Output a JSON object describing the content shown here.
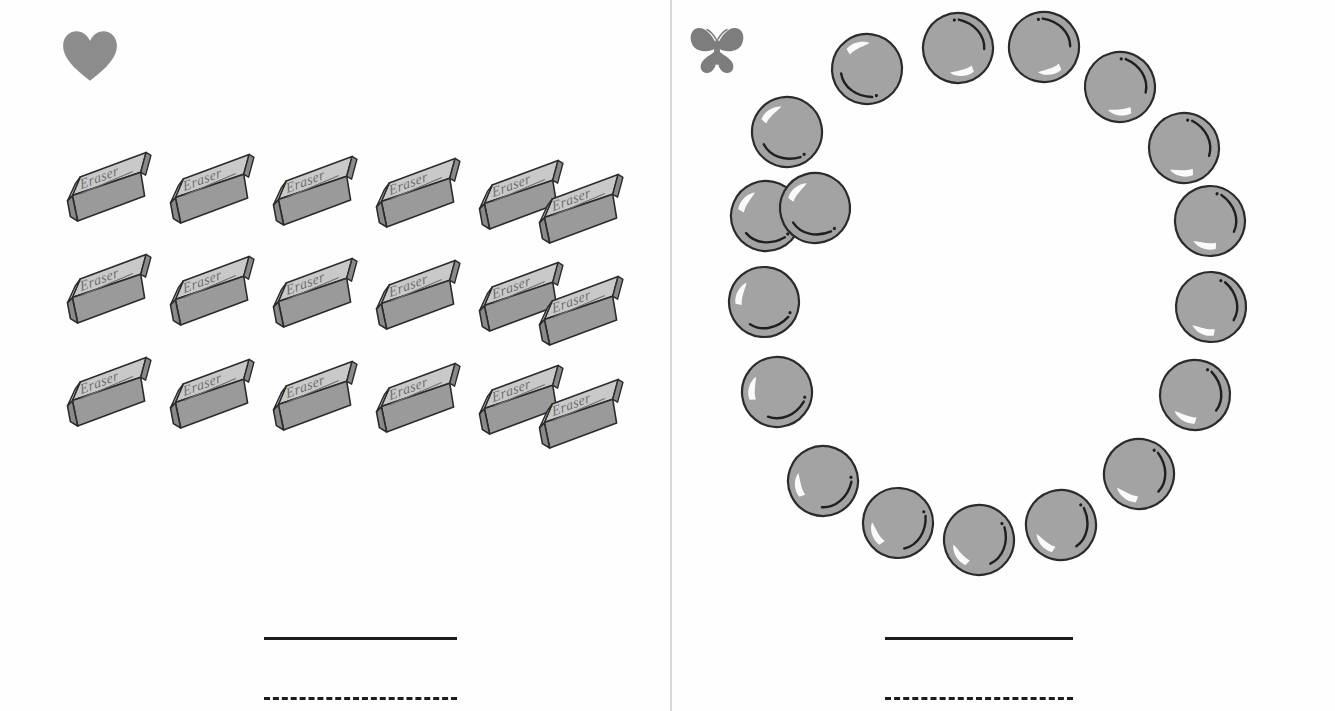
{
  "worksheet": {
    "title": "Counting Worksheet",
    "background_color": "#fefefe",
    "divider_color": "#d8d8d8"
  },
  "panels": [
    {
      "id": "left",
      "marker_icon": "heart-icon",
      "marker_color": "#8c8c8c",
      "object_name": "Eraser",
      "object_label": "Eraser",
      "arrangement": "grid",
      "rows": 3,
      "columns": 6,
      "count": 18,
      "object_colors": {
        "top": "#c9c9c9",
        "front": "#9a9a9a",
        "side": "#8a8a8a",
        "outline": "#2b2b2b",
        "text": "#6e6e6e"
      },
      "answer_lines": [
        {
          "style": "solid",
          "label": ""
        },
        {
          "style": "dashed",
          "label": ""
        }
      ]
    },
    {
      "id": "right",
      "marker_icon": "butterfly-icon",
      "marker_color": "#7d7d7d",
      "object_name": "Marble",
      "object_label": "",
      "arrangement": "circle",
      "rows": 0,
      "columns": 0,
      "count": 18,
      "object_colors": {
        "fill": "#a3a3a3",
        "outline": "#2b2b2b",
        "highlight": "#ffffff",
        "shadow_arc": "#1f1f1f"
      },
      "answer_lines": [
        {
          "style": "solid",
          "label": ""
        },
        {
          "style": "dashed",
          "label": ""
        }
      ]
    }
  ],
  "eraser_positions": [
    {
      "x": 0,
      "y": 0,
      "rot": -14
    },
    {
      "x": 103,
      "y": 2,
      "rot": -14
    },
    {
      "x": 206,
      "y": 4,
      "rot": -14
    },
    {
      "x": 309,
      "y": 6,
      "rot": -14
    },
    {
      "x": 412,
      "y": 8,
      "rot": -14
    },
    {
      "x": 472,
      "y": 22,
      "rot": -14
    },
    {
      "x": 0,
      "y": 102,
      "rot": -14
    },
    {
      "x": 103,
      "y": 104,
      "rot": -14
    },
    {
      "x": 206,
      "y": 106,
      "rot": -14
    },
    {
      "x": 309,
      "y": 108,
      "rot": -14
    },
    {
      "x": 412,
      "y": 110,
      "rot": -14
    },
    {
      "x": 472,
      "y": 124,
      "rot": -14
    },
    {
      "x": 0,
      "y": 205,
      "rot": -14
    },
    {
      "x": 103,
      "y": 207,
      "rot": -14
    },
    {
      "x": 206,
      "y": 209,
      "rot": -14
    },
    {
      "x": 309,
      "y": 211,
      "rot": -14
    },
    {
      "x": 412,
      "y": 213,
      "rot": -14
    },
    {
      "x": 472,
      "y": 227,
      "rot": -14
    }
  ],
  "marble_positions": [
    {
      "x": 156,
      "y": 30,
      "rot": 8
    },
    {
      "x": 247,
      "y": 9,
      "rot": 200
    },
    {
      "x": 333,
      "y": 8,
      "rot": 196
    },
    {
      "x": 409,
      "y": 48,
      "rot": 210
    },
    {
      "x": 473,
      "y": 109,
      "rot": 215
    },
    {
      "x": 499,
      "y": 182,
      "rot": 222
    },
    {
      "x": 500,
      "y": 268,
      "rot": 228
    },
    {
      "x": 484,
      "y": 356,
      "rot": 234
    },
    {
      "x": 428,
      "y": 435,
      "rot": 240
    },
    {
      "x": 350,
      "y": 486,
      "rot": 252
    },
    {
      "x": 268,
      "y": 501,
      "rot": 262
    },
    {
      "x": 187,
      "y": 484,
      "rot": 274
    },
    {
      "x": 112,
      "y": 442,
      "rot": 290
    },
    {
      "x": 66,
      "y": 353,
      "rot": 308
    },
    {
      "x": 53,
      "y": 263,
      "rot": 320
    },
    {
      "x": 55,
      "y": 177,
      "rot": 337
    },
    {
      "x": 76,
      "y": 93,
      "rot": 350
    },
    {
      "x": 104,
      "y": 169,
      "rot": 344
    }
  ]
}
